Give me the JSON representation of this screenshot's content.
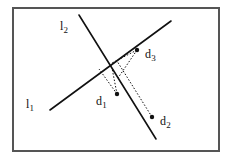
{
  "figure": {
    "kind": "geometry-diagram",
    "background_color": "#ffffff",
    "ink_color": "#111111",
    "frame": {
      "name": "outer-border",
      "x": 13,
      "y": 8,
      "width": 206,
      "height": 143,
      "stroke_color": "#555555",
      "stroke_width": 2
    },
    "lines": [
      {
        "id": "l1",
        "label_base": "l",
        "label_sub": "1",
        "x1": 50,
        "y1": 110,
        "x2": 171,
        "y2": 21,
        "stroke_color": "#111111",
        "stroke_width": 1.6,
        "label_x": 26,
        "label_y": 95
      },
      {
        "id": "l2",
        "label_base": "l",
        "label_sub": "2",
        "x1": 79,
        "y1": 15,
        "x2": 156,
        "y2": 139,
        "stroke_color": "#111111",
        "stroke_width": 1.6,
        "label_x": 60,
        "label_y": 17
      }
    ],
    "intersection": {
      "x": 105,
      "y": 67
    },
    "points": [
      {
        "id": "d1",
        "label_base": "d",
        "label_sub": "1",
        "x": 117,
        "y": 94,
        "radius": 2.2,
        "label_x": 96,
        "label_y": 92
      },
      {
        "id": "d2",
        "label_base": "d",
        "label_sub": "2",
        "x": 152,
        "y": 117,
        "radius": 2.2,
        "label_x": 160,
        "label_y": 112
      },
      {
        "id": "d3",
        "label_base": "d",
        "label_sub": "3",
        "x": 137,
        "y": 50,
        "radius": 2.2,
        "label_x": 145,
        "label_y": 45
      }
    ],
    "projections": [
      {
        "id": "d1-to-l1",
        "from": "d1",
        "to": "l1",
        "x1": 117,
        "y1": 94,
        "x2": 99,
        "y2": 69,
        "dash": "1.5 1.8"
      },
      {
        "id": "d1-to-l2",
        "from": "d1",
        "to": "l2",
        "x1": 117,
        "y1": 94,
        "x2": 112,
        "y2": 68,
        "dash": "1.5 1.8"
      },
      {
        "id": "d3-to-l1",
        "from": "d3",
        "to": "l1",
        "x1": 137,
        "y1": 50,
        "x2": 112,
        "y2": 63,
        "dash": "1.5 1.8"
      },
      {
        "id": "d3-to-l2",
        "from": "d3",
        "to": "l2",
        "x1": 137,
        "y1": 50,
        "x2": 118,
        "y2": 78,
        "dash": "1.5 1.8"
      },
      {
        "id": "d2-to-l2",
        "from": "d2",
        "to": "l2",
        "x1": 152,
        "y1": 117,
        "x2": 117,
        "y2": 61,
        "dash": "1.5 1.8"
      }
    ]
  }
}
